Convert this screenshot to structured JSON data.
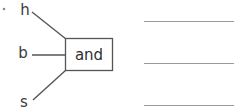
{
  "diagram": {
    "type": "logic-gate-diagram",
    "gate": {
      "label": "and",
      "shape": "rectangle",
      "x": 65,
      "y": 38,
      "width": 48,
      "height": 33,
      "stroke_color": "#555555",
      "fill_color": "#ffffff",
      "text_color": "#2e2e2e"
    },
    "inputs": [
      {
        "label": "h",
        "label_x": 25,
        "label_y": 10,
        "wire_from_x": 32,
        "wire_from_y": 12,
        "wire_to_x": 66,
        "wire_to_y": 39,
        "wire_style": "diagonal-down"
      },
      {
        "label": "b",
        "label_x": 23,
        "label_y": 53,
        "wire_from_x": 32,
        "wire_from_y": 55,
        "wire_to_x": 66,
        "wire_to_y": 55,
        "wire_style": "horizontal"
      },
      {
        "label": "s",
        "label_x": 24,
        "label_y": 102,
        "wire_from_x": 33,
        "wire_from_y": 100,
        "wire_to_x": 66,
        "wire_to_y": 70,
        "wire_style": "diagonal-up"
      }
    ],
    "bullet": {
      "name": "list-bullet-dot",
      "x": 4,
      "y": 9,
      "radius": 1.3,
      "color": "#8a8a8a"
    },
    "rule_lines": [
      {
        "name": "rule-line-1",
        "x1": 144,
        "y1": 21.5,
        "x2": 234,
        "y2": 21.5,
        "color": "#9a9a9a"
      },
      {
        "name": "rule-line-2",
        "x1": 144,
        "y1": 63.5,
        "x2": 234,
        "y2": 63.5,
        "color": "#9a9a9a"
      },
      {
        "name": "rule-line-3",
        "x1": 144,
        "y1": 105.5,
        "x2": 234,
        "y2": 105.5,
        "color": "#9a9a9a"
      }
    ]
  },
  "colors": {
    "background": "#ffffff",
    "wire": "#555555",
    "rule": "#9a9a9a",
    "label_text": "#3a3a3a",
    "gate_text": "#2e2e2e"
  }
}
